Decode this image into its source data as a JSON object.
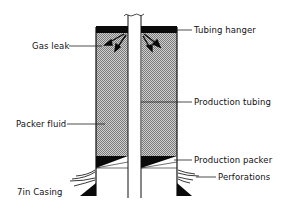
{
  "diagram": {
    "type": "well-schematic",
    "labels": {
      "gas_leak": "Gas leak",
      "tubing_hanger": "Tubing hanger",
      "production_tubing": "Production tubing",
      "packer_fluid": "Packer fluid",
      "production_packer": "Production packer",
      "perforations": "Perforations",
      "casing": "7in Casing"
    },
    "colors": {
      "line": "#111111",
      "fill_hatch": "#9a9a9a",
      "solid": "#0a0a0a",
      "background": "#ffffff"
    }
  }
}
